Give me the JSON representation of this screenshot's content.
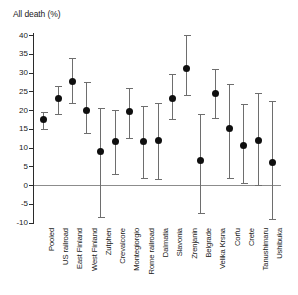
{
  "chart_data": {
    "type": "scatter",
    "title": "All death (%)",
    "xlabel": "",
    "ylabel": "All death (%)",
    "ylim": [
      -10,
      40
    ],
    "yticks": [
      40,
      35,
      30,
      25,
      20,
      15,
      10,
      5,
      0,
      -5,
      -10
    ],
    "grid": false,
    "legend": null,
    "zero_reference_line": 0,
    "marker_color": "#0f0f0f",
    "errorbar_color": "#6e6e6e",
    "categories": [
      "Pooled",
      "US railroad",
      "East Finland",
      "West Finland",
      "Zutphen",
      "Crevalcore",
      "Montegiorgio",
      "Rome railroad",
      "Dalmatia",
      "Slavonia",
      "Zrenjanin",
      "Belgrade",
      "Velika Krsna",
      "Corfu",
      "Crete",
      "Tanushimaru",
      "Ushibuka"
    ],
    "values": [
      17.5,
      23.0,
      27.5,
      20.0,
      9.0,
      11.5,
      19.5,
      11.5,
      12.0,
      23.0,
      31.0,
      6.5,
      24.5,
      15.0,
      10.5,
      12.0,
      6.0
    ],
    "ci_low": [
      15.0,
      19.0,
      22.0,
      14.0,
      -8.5,
      3.0,
      12.5,
      2.0,
      1.5,
      17.5,
      24.0,
      -7.5,
      18.0,
      2.0,
      0.5,
      0.0,
      -9.0
    ],
    "ci_high": [
      19.5,
      26.5,
      34.0,
      27.5,
      20.5,
      20.0,
      26.0,
      21.0,
      22.0,
      29.5,
      40.0,
      19.0,
      31.0,
      27.0,
      21.5,
      24.5,
      22.5
    ]
  }
}
